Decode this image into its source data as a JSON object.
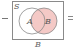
{
  "diagram": {
    "operator_left": "−",
    "operator_right": "=",
    "universe_label": "S",
    "sets": [
      {
        "label": "A",
        "shaded": false
      },
      {
        "label": "B",
        "shaded": true
      }
    ],
    "caption": "B",
    "colors": {
      "shade": "#f4c9c6",
      "outline": "#8a8a8a",
      "frame": "#8a8a8a"
    }
  }
}
